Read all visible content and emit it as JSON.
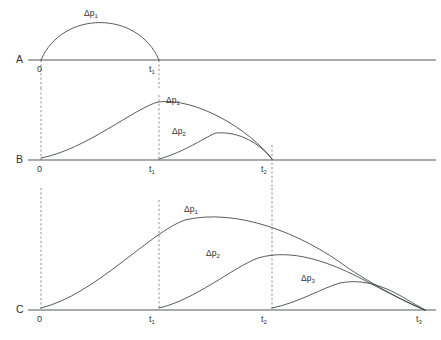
{
  "figure": {
    "type": "diagram",
    "width": 441,
    "height": 340,
    "background_color": "#ffffff",
    "line_color": "#3a3d40",
    "baseline_color": "#555a5d",
    "dashed_color": "#6e7376"
  },
  "axis": {
    "ticks": [
      {
        "id": "t0",
        "base": "0",
        "sub": "",
        "x": 41
      },
      {
        "id": "t1",
        "base": "t",
        "sub": "1",
        "x": 159
      },
      {
        "id": "t2",
        "base": "t",
        "sub": "2",
        "x": 272
      },
      {
        "id": "t3",
        "base": "t",
        "sub": "3",
        "x": 425
      }
    ],
    "line_start_x": 28,
    "line_end_x": 436
  },
  "panels": [
    {
      "id": "panel-a",
      "label": "A",
      "baseline_y": 60,
      "label_x": 16,
      "label_y": 63,
      "ticks": [
        {
          "base": "0",
          "sub": "",
          "x": 37,
          "y": 72
        },
        {
          "base": "t",
          "sub": "1",
          "x": 149,
          "y": 72
        }
      ],
      "dashed_lines": [
        {
          "x": 41,
          "y1": 60,
          "y2": 88
        },
        {
          "x": 159,
          "y1": 60,
          "y2": 88
        }
      ],
      "curves": [
        {
          "name": "delta-p-1",
          "label_base": "Δp",
          "label_sub": "1",
          "label_x": 84,
          "label_y": 16,
          "path": "M 41 60 C 62 10 138 10 159 60"
        }
      ]
    },
    {
      "id": "panel-b",
      "label": "B",
      "baseline_y": 160,
      "label_x": 16,
      "label_y": 163,
      "ticks": [
        {
          "base": "0",
          "sub": "",
          "x": 37,
          "y": 172
        },
        {
          "base": "t",
          "sub": "1",
          "x": 149,
          "y": 172
        },
        {
          "base": "t",
          "sub": "2",
          "x": 261,
          "y": 172
        }
      ],
      "dashed_lines": [
        {
          "x": 41,
          "y1": 88,
          "y2": 160
        },
        {
          "x": 159,
          "y1": 95,
          "y2": 160
        },
        {
          "x": 272,
          "y1": 145,
          "y2": 188
        }
      ],
      "curves": [
        {
          "name": "delta-p-1",
          "label_base": "Δp",
          "label_sub": "1",
          "label_x": 166,
          "label_y": 103,
          "path": "M 41 158 C 85 150 135 108 158 102 C 196 97 250 130 272 159"
        },
        {
          "name": "delta-p-2",
          "label_base": "Δp",
          "label_sub": "2",
          "label_x": 172,
          "label_y": 134,
          "path": "M 159 159 C 185 152 207 136 216 133 C 240 131 260 144 272 159"
        }
      ]
    },
    {
      "id": "panel-c",
      "label": "C",
      "baseline_y": 310,
      "label_x": 16,
      "label_y": 313,
      "ticks": [
        {
          "base": "0",
          "sub": "",
          "x": 37,
          "y": 322
        },
        {
          "base": "t",
          "sub": "1",
          "x": 149,
          "y": 322
        },
        {
          "base": "t",
          "sub": "2",
          "x": 261,
          "y": 322
        },
        {
          "base": "t",
          "sub": "3",
          "x": 416,
          "y": 322
        }
      ],
      "dashed_lines": [
        {
          "x": 41,
          "y1": 188,
          "y2": 310
        },
        {
          "x": 159,
          "y1": 200,
          "y2": 310
        },
        {
          "x": 272,
          "y1": 188,
          "y2": 310
        }
      ],
      "curves": [
        {
          "name": "delta-p-1",
          "label_base": "Δp",
          "label_sub": "1",
          "label_x": 184,
          "label_y": 212,
          "path": "M 41 308 C 95 295 150 232 185 220 C 235 208 300 232 348 268 C 385 292 412 305 425 310"
        },
        {
          "name": "delta-p-2",
          "label_base": "Δp",
          "label_sub": "2",
          "label_x": 206,
          "label_y": 256,
          "path": "M 159 308 C 195 300 232 268 258 258 C 292 248 330 262 366 281 C 396 297 415 306 425 310"
        },
        {
          "name": "delta-p-3",
          "label_base": "Δp",
          "label_sub": "3",
          "label_x": 301,
          "label_y": 281,
          "path": "M 272 308 C 298 303 322 288 340 283 C 365 278 388 288 406 299 C 416 305 422 308 425 310"
        }
      ]
    }
  ]
}
